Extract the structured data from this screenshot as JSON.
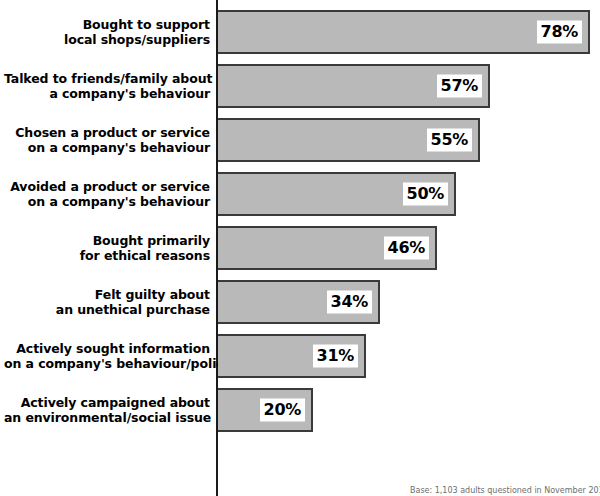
{
  "chart": {
    "type": "bar",
    "orientation": "horizontal",
    "title": "",
    "subtitle": "",
    "xlabel": "",
    "ylabel": "",
    "footnote": "Base: 1,103 adults questioned in November 2010",
    "colors": {
      "bar_fill": "#b9b9b9",
      "bar_border": "#3a3a3a",
      "axis": "#1a1a1a",
      "text": "#000000",
      "footnote_text": "#6e6e6e",
      "background": "#ffffff"
    }
  },
  "chart_data": {
    "type": "bar",
    "title": "",
    "xlabel": "",
    "ylabel": "",
    "xlim": [
      0,
      100
    ],
    "grid": false,
    "legend": false,
    "value_suffix": "%",
    "categories": [
      "Bought to support local shops/suppliers",
      "Talked to friends/family about a company's behaviour",
      "Chosen a product or service on a company's behaviour",
      "Avoided a product or service on a company's behaviour",
      "Bought primarily for ethical reasons",
      "Felt guilty about an unethical purchase",
      "Actively sought information on a company's behaviour/policies",
      "Actively campaigned about an environmental/social issue"
    ],
    "values": [
      78,
      57,
      55,
      50,
      46,
      34,
      31,
      20
    ],
    "bars": [
      {
        "label_line1": "Bought to support",
        "label_line2": "local shops/suppliers",
        "value": 78,
        "value_label": "78%"
      },
      {
        "label_line1": "Talked to friends/family about",
        "label_line2": "a company's behaviour",
        "value": 57,
        "value_label": "57%"
      },
      {
        "label_line1": "Chosen a product or service",
        "label_line2": "on a company's behaviour",
        "value": 55,
        "value_label": "55%"
      },
      {
        "label_line1": "Avoided a product or service",
        "label_line2": "on a company's behaviour",
        "value": 50,
        "value_label": "50%"
      },
      {
        "label_line1": "Bought primarily",
        "label_line2": "for ethical reasons",
        "value": 46,
        "value_label": "46%"
      },
      {
        "label_line1": "Felt guilty about",
        "label_line2": "an unethical purchase",
        "value": 34,
        "value_label": "34%"
      },
      {
        "label_line1": "Actively sought information",
        "label_line2": "on a company's behaviour/policies",
        "value": 31,
        "value_label": "31%"
      },
      {
        "label_line1": "Actively campaigned about",
        "label_line2": "an environmental/social issue",
        "value": 20,
        "value_label": "20%"
      }
    ]
  }
}
